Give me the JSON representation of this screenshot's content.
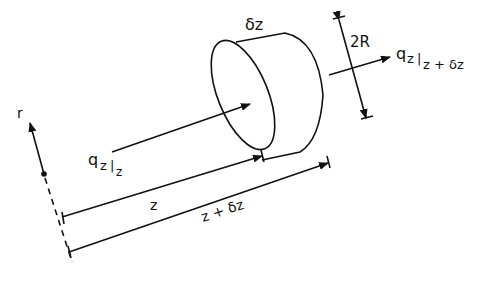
{
  "diagram": {
    "type": "cylindrical shell element heat flux",
    "labels": {
      "delta_z": "δz",
      "two_R": "2R",
      "r": "r",
      "z": "z",
      "z_plus_dz": "z + δz",
      "q_in_main": "q",
      "q_in_sub1": "z",
      "q_in_bar": "|",
      "q_in_sub2": "z",
      "q_out_main": "q",
      "q_out_sub1": "z",
      "q_out_bar": "|",
      "q_out_sub2": "z + δz"
    },
    "colors": {
      "ink": "#111111",
      "background": "#ffffff"
    }
  }
}
